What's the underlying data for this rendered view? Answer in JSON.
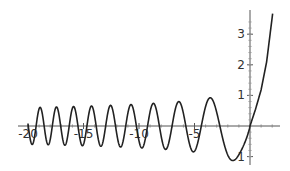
{
  "chart_data": {
    "type": "line",
    "title": "",
    "xlabel": "",
    "ylabel": "",
    "xlim": [
      -20.5,
      2.7
    ],
    "ylim": [
      -1.15,
      3.75
    ],
    "grid": false,
    "legend": null,
    "x_ticks": [
      {
        "value": -20,
        "label": "-20"
      },
      {
        "value": -15,
        "label": "-15"
      },
      {
        "value": -10,
        "label": "-10"
      },
      {
        "value": -5,
        "label": "-5"
      }
    ],
    "y_ticks": [
      {
        "value": 1,
        "label": "1"
      },
      {
        "value": 2,
        "label": "2"
      },
      {
        "value": 3,
        "label": "3"
      },
      {
        "value": -1,
        "label": "1"
      }
    ],
    "series": [
      {
        "name": "f(x)",
        "color": "#222222",
        "x_range": [
          -20,
          2.05
        ],
        "description": "Airy-type oscillation for x<0 (amplitude ~1.27|x|^-1/4), passing through origin, rapid growth for x>0",
        "model": {
          "negative": {
            "amplitude": 1.27,
            "amp_power": -0.25,
            "phase_coeff": 0.6667,
            "phase_power": 1.5,
            "phase_offset": 3.3
          },
          "positive": {
            "values": [
              [
                0,
                0
              ],
              [
                0.5,
                0.55
              ],
              [
                1,
                1.18
              ],
              [
                1.5,
                2.1
              ],
              [
                2.05,
                3.7
              ]
            ]
          }
        },
        "key_points": [
          {
            "x": -19.3,
            "y": 0.6,
            "kind": "peak"
          },
          {
            "x": -17.7,
            "y": 0.6,
            "kind": "peak"
          },
          {
            "x": -16.0,
            "y": 0.61,
            "kind": "peak"
          },
          {
            "x": -14.4,
            "y": 0.62,
            "kind": "peak"
          },
          {
            "x": -12.7,
            "y": 0.65,
            "kind": "peak"
          },
          {
            "x": -10.8,
            "y": 0.72,
            "kind": "peak"
          },
          {
            "x": -8.8,
            "y": 0.78,
            "kind": "peak"
          },
          {
            "x": -6.5,
            "y": 0.82,
            "kind": "peak"
          },
          {
            "x": -5.2,
            "y": -0.82,
            "kind": "trough"
          },
          {
            "x": -4.2,
            "y": 0,
            "kind": "zero"
          },
          {
            "x": -3.6,
            "y": 0.92,
            "kind": "peak"
          },
          {
            "x": -2.6,
            "y": 0,
            "kind": "zero"
          },
          {
            "x": -1.8,
            "y": -1.08,
            "kind": "trough"
          },
          {
            "x": 0,
            "y": 0,
            "kind": "zero"
          },
          {
            "x": 1,
            "y": 1.18,
            "kind": "point"
          },
          {
            "x": 1.5,
            "y": 2.1,
            "kind": "point"
          },
          {
            "x": 2.05,
            "y": 3.7,
            "kind": "end"
          }
        ]
      }
    ]
  },
  "layout": {
    "origin_px": [
      250,
      126
    ],
    "px_per_x": 11.1,
    "px_per_y": 30.6,
    "x_axis_px": [
      18,
      280
    ],
    "y_axis_px": [
      10,
      165
    ]
  }
}
